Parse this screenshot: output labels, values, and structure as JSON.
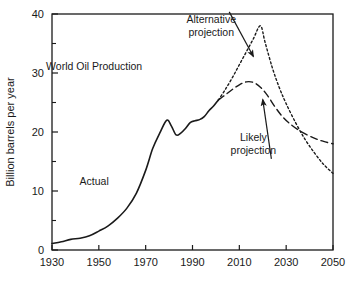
{
  "chart_data": {
    "type": "line",
    "title": "World Oil Production",
    "xlabel": "",
    "ylabel": "Billion barrels per year",
    "xlim": [
      1930,
      2050
    ],
    "ylim": [
      0,
      40
    ],
    "xticks": [
      1930,
      1950,
      1970,
      1990,
      2010,
      2030,
      2050
    ],
    "xtick_labels": [
      "1930",
      "1950",
      "1970",
      "1990",
      "2010",
      "2030",
      "2050"
    ],
    "yticks": [
      0,
      10,
      20,
      30,
      40
    ],
    "ytick_labels": [
      "0",
      "10",
      "20",
      "30",
      "40"
    ],
    "yminorticks": [
      5,
      15,
      25,
      35
    ],
    "grid": false,
    "legend": "none",
    "annotations": [
      {
        "name": "plot-title-annotation",
        "text": "World Oil Production",
        "x": 1948,
        "y": 30.5
      },
      {
        "name": "actual-annotation",
        "text": "Actual",
        "x": 1948,
        "y": 11.0
      },
      {
        "name": "alternative-projection-annotation",
        "text": "Alternative\nprojection",
        "x": 1998,
        "y": 38.5,
        "arrow_to": {
          "x": 2016,
          "y": 32.8
        }
      },
      {
        "name": "likely-projection-annotation",
        "text": "Likely\nprojection",
        "x": 2016,
        "y": 18.5,
        "arrow_to": {
          "x": 2020,
          "y": 25.5
        }
      }
    ],
    "series": [
      {
        "name": "Actual",
        "style": "solid",
        "points": [
          [
            1930,
            1.1
          ],
          [
            1934,
            1.4
          ],
          [
            1938,
            1.8
          ],
          [
            1942,
            2.0
          ],
          [
            1946,
            2.4
          ],
          [
            1950,
            3.2
          ],
          [
            1954,
            4.1
          ],
          [
            1958,
            5.4
          ],
          [
            1962,
            7.1
          ],
          [
            1966,
            9.6
          ],
          [
            1970,
            13.5
          ],
          [
            1973,
            17.2
          ],
          [
            1976,
            19.8
          ],
          [
            1979,
            22.0
          ],
          [
            1981,
            21.0
          ],
          [
            1983,
            19.5
          ],
          [
            1985,
            19.8
          ],
          [
            1987,
            20.6
          ],
          [
            1989,
            21.6
          ],
          [
            1991,
            21.9
          ],
          [
            1993,
            22.1
          ],
          [
            1995,
            22.6
          ],
          [
            1997,
            23.6
          ],
          [
            1999,
            24.4
          ],
          [
            2001,
            25.4
          ]
        ]
      },
      {
        "name": "Alternative projection",
        "style": "dotted",
        "points": [
          [
            2001,
            25.4
          ],
          [
            2004,
            27.2
          ],
          [
            2007,
            29.2
          ],
          [
            2010,
            31.4
          ],
          [
            2013,
            33.6
          ],
          [
            2016,
            35.8
          ],
          [
            2019,
            38.0
          ],
          [
            2021,
            35.2
          ],
          [
            2024,
            31.0
          ],
          [
            2027,
            27.6
          ],
          [
            2030,
            24.8
          ],
          [
            2034,
            21.6
          ],
          [
            2038,
            18.8
          ],
          [
            2042,
            16.5
          ],
          [
            2046,
            14.5
          ],
          [
            2050,
            13.0
          ]
        ]
      },
      {
        "name": "Likely projection",
        "style": "dashed",
        "points": [
          [
            2001,
            25.4
          ],
          [
            2004,
            26.3
          ],
          [
            2007,
            27.2
          ],
          [
            2010,
            28.0
          ],
          [
            2013,
            28.5
          ],
          [
            2016,
            28.4
          ],
          [
            2019,
            27.6
          ],
          [
            2022,
            26.2
          ],
          [
            2025,
            24.4
          ],
          [
            2028,
            22.8
          ],
          [
            2031,
            21.6
          ],
          [
            2035,
            20.4
          ],
          [
            2039,
            19.5
          ],
          [
            2043,
            18.8
          ],
          [
            2046,
            18.4
          ],
          [
            2050,
            18.0
          ]
        ]
      }
    ]
  },
  "figure": {
    "background": "#ffffff",
    "axis_color": "#1a1a1a",
    "line_color": "#1a1a1a"
  }
}
